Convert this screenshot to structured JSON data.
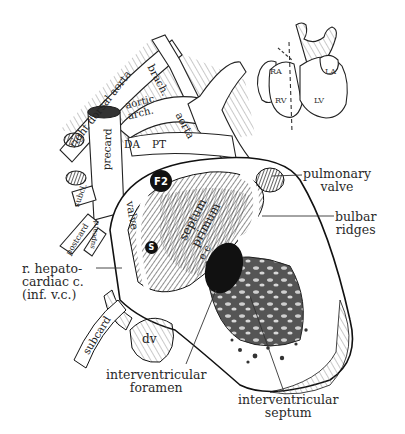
{
  "figure": {
    "inset": {
      "labels": {
        "ra": "RA",
        "la": "LA",
        "rv": "RV",
        "lv": "LV"
      }
    },
    "vessels": {
      "right_dorsal_aorta": "right dorsal aorta",
      "brach": "brach.",
      "aortic_arch": "aortic arch.",
      "aorta": "aorta",
      "precard": "precard",
      "da": "DA",
      "pt": "PT",
      "subcl": "subcl.",
      "postcard": "postcard",
      "supcard": "supcard",
      "subcard": "subcard",
      "dv": "dv"
    },
    "interior": {
      "f2": "F2",
      "s": "S",
      "valve": "valve",
      "septum_primum": "septum primum",
      "ec": "e c"
    },
    "callouts": {
      "pulmonary_valve": [
        "pulmonary",
        "valve"
      ],
      "bulbar_ridges": [
        "bulbar",
        "ridges"
      ],
      "hepatocardiac": [
        "r. hepato-",
        "cardiac c."
      ],
      "hepatocardiac_note": "(inf. v.c.)",
      "interventricular_foramen": [
        "interventricular",
        "foramen"
      ],
      "interventricular_septum": [
        "interventricular",
        "septum"
      ]
    }
  }
}
